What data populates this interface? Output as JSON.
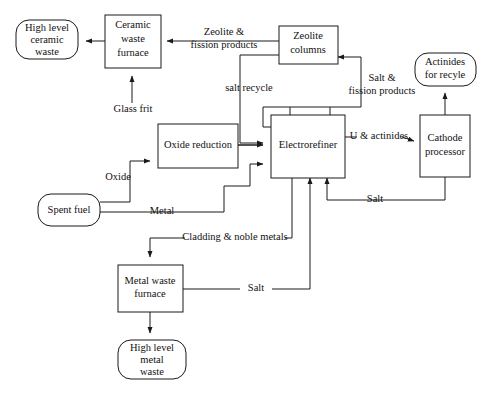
{
  "diagram": {
    "type": "process-flow",
    "canvas": {
      "width": 488,
      "height": 397
    },
    "colors": {
      "stroke": "#1a1a1a",
      "fill": "#ffffff",
      "text": "#111111"
    },
    "nodes": [
      {
        "id": "high-level-ceramic-waste",
        "shape": "rounded",
        "lines": [
          "High level",
          "ceramic",
          "waste"
        ],
        "line1": "High level",
        "line2": "ceramic",
        "line3": "waste"
      },
      {
        "id": "ceramic-waste-furnace",
        "shape": "rect",
        "lines": [
          "Ceramic",
          "waste",
          "furnace"
        ],
        "line1": "Ceramic",
        "line2": "waste",
        "line3": "furnace"
      },
      {
        "id": "zeolite-columns",
        "shape": "rect",
        "lines": [
          "Zeolite",
          "columns"
        ],
        "line1": "Zeolite",
        "line2": "columns"
      },
      {
        "id": "actinides-for-recycle",
        "shape": "rounded",
        "lines": [
          "Actinides",
          "for recyle"
        ],
        "line1": "Actinides",
        "line2": "for recyle"
      },
      {
        "id": "oxide-reduction",
        "shape": "rect",
        "lines": [
          "Oxide reduction"
        ],
        "line1": "Oxide reduction"
      },
      {
        "id": "electrorefiner",
        "shape": "rect",
        "lines": [
          "Electrorefiner"
        ],
        "line1": "Electrorefiner"
      },
      {
        "id": "cathode-processor",
        "shape": "rect",
        "lines": [
          "Cathode",
          "processor"
        ],
        "line1": "Cathode",
        "line2": "processor"
      },
      {
        "id": "spent-fuel",
        "shape": "rounded",
        "lines": [
          "Spent fuel"
        ],
        "line1": "Spent fuel"
      },
      {
        "id": "metal-waste-furnace",
        "shape": "rect",
        "lines": [
          "Metal waste",
          "furnace"
        ],
        "line1": "Metal waste",
        "line2": "furnace"
      },
      {
        "id": "high-level-metal-waste",
        "shape": "rounded",
        "lines": [
          "High level",
          "metal",
          "waste"
        ],
        "line1": "High level",
        "line2": "metal",
        "line3": "waste"
      }
    ],
    "edge_labels": {
      "zeolite_fission_products_l1": "Zeolite &",
      "zeolite_fission_products_l2": "fission products",
      "glass_frit": "Glass frit",
      "salt_recycle": "salt recycle",
      "salt_fission_products_l1": "Salt &",
      "salt_fission_products_l2": "fission products",
      "u_and_actinides": "U & actinides",
      "oxide": "Oxide",
      "metal": "Metal",
      "salt_from_cathode": "Salt",
      "cladding_noble_metals": "Cladding & noble metals",
      "salt_from_metal_furnace": "Salt"
    }
  }
}
